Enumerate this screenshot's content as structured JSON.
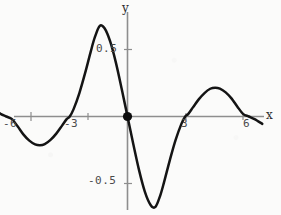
{
  "chart_data": {
    "type": "line",
    "title": "",
    "subtitle": "",
    "xlabel": "x",
    "ylabel": "y",
    "xlim": [
      -7.2,
      7.0
    ],
    "ylim": [
      -0.78,
      0.8
    ],
    "grid": false,
    "legend": null,
    "x_ticks": [
      -6,
      -3,
      3,
      6
    ],
    "x_tick_labels": [
      "-6",
      "-3",
      "3",
      "6"
    ],
    "y_ticks": [
      0.5,
      -0.5
    ],
    "y_tick_labels": [
      "0.5",
      "-0.5"
    ],
    "annotations": [
      {
        "name": "origin-point",
        "x": 0,
        "y": 0,
        "marker": "filled-circle"
      }
    ],
    "series": [
      {
        "name": "damped oscillation",
        "color": "#111111",
        "zeros": [
          -6,
          -3,
          0,
          3,
          6
        ],
        "extrema": [
          {
            "x": -4.55,
            "y": -0.215
          },
          {
            "x": -1.45,
            "y": 0.68
          },
          {
            "x": 1.45,
            "y": -0.68
          },
          {
            "x": 4.55,
            "y": 0.215
          }
        ],
        "x": [
          -7.0,
          -6.6,
          -6.3,
          -6.0,
          -5.7,
          -5.4,
          -5.1,
          -4.8,
          -4.55,
          -4.3,
          -4.0,
          -3.7,
          -3.4,
          -3.15,
          -3.0,
          -2.8,
          -2.5,
          -2.2,
          -1.9,
          -1.7,
          -1.45,
          -1.2,
          -0.9,
          -0.6,
          -0.3,
          0.0,
          0.3,
          0.6,
          0.9,
          1.2,
          1.45,
          1.7,
          1.9,
          2.2,
          2.5,
          2.8,
          3.0,
          3.15,
          3.4,
          3.7,
          4.0,
          4.3,
          4.55,
          4.8,
          5.1,
          5.4,
          5.7,
          6.0,
          6.3,
          6.6,
          7.0
        ],
        "y": [
          0.055,
          0.02,
          0.0,
          -0.02,
          -0.075,
          -0.135,
          -0.18,
          -0.208,
          -0.215,
          -0.207,
          -0.175,
          -0.128,
          -0.068,
          -0.018,
          0.0,
          0.055,
          0.175,
          0.325,
          0.49,
          0.59,
          0.675,
          0.66,
          0.56,
          0.4,
          0.205,
          0.0,
          -0.205,
          -0.4,
          -0.56,
          -0.66,
          -0.675,
          -0.59,
          -0.49,
          -0.325,
          -0.175,
          -0.055,
          0.0,
          0.018,
          0.068,
          0.128,
          0.175,
          0.207,
          0.215,
          0.208,
          0.18,
          0.135,
          0.075,
          0.02,
          0.0,
          -0.02,
          -0.055
        ]
      }
    ]
  },
  "axes": {
    "x_axis_name": "x",
    "y_axis_name": "y",
    "x_ticks": [
      {
        "label": "-6"
      },
      {
        "label": "-3"
      },
      {
        "label": "3"
      },
      {
        "label": "6"
      }
    ],
    "y_ticks": [
      {
        "label": "0.5"
      },
      {
        "label": "-0.5"
      }
    ]
  }
}
